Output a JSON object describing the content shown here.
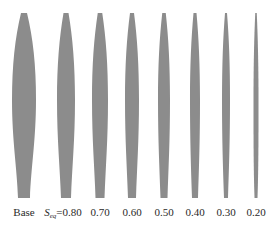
{
  "figure": {
    "fill_color": "#8c8c8c",
    "background": "#ffffff",
    "blades": [
      {
        "id": "base",
        "label": "Base",
        "prefix": "",
        "cx": 24,
        "max_w": 24,
        "tip_w": 6,
        "root_w": 12
      },
      {
        "id": "0.80",
        "label": "=0.80",
        "prefix": "S",
        "sub": "eq",
        "cx": 66,
        "max_w": 18,
        "tip_w": 5,
        "root_w": 10
      },
      {
        "id": "0.70",
        "label": "0.70",
        "prefix": "",
        "cx": 100,
        "max_w": 16,
        "tip_w": 4.5,
        "root_w": 9
      },
      {
        "id": "0.60",
        "label": "0.60",
        "prefix": "",
        "cx": 132,
        "max_w": 14,
        "tip_w": 4,
        "root_w": 8
      },
      {
        "id": "0.50",
        "label": "0.50",
        "prefix": "",
        "cx": 164,
        "max_w": 12,
        "tip_w": 3.5,
        "root_w": 7
      },
      {
        "id": "0.40",
        "label": "0.40",
        "prefix": "",
        "cx": 195,
        "max_w": 10,
        "tip_w": 3,
        "root_w": 6
      },
      {
        "id": "0.30",
        "label": "0.30",
        "prefix": "",
        "cx": 226,
        "max_w": 8,
        "tip_w": 2,
        "root_w": 4
      },
      {
        "id": "0.20",
        "label": "0.20",
        "prefix": "",
        "cx": 256,
        "max_w": 5,
        "tip_w": 1.5,
        "root_w": 3
      }
    ],
    "geometry": {
      "top_y": 13,
      "mid_y": 100,
      "bottom_y": 198
    }
  }
}
